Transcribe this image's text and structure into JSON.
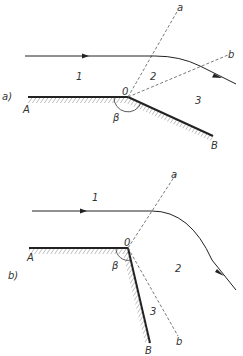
{
  "figure_a": {
    "tag": "a)",
    "region_labels": [
      "1",
      "2",
      "3"
    ],
    "point_labels": {
      "A": "A",
      "O": "0",
      "B": "B"
    },
    "line_labels": {
      "a": "a",
      "b": "b"
    },
    "angle_label": "β"
  },
  "figure_b": {
    "tag": "b)",
    "region_labels": [
      "1",
      "2",
      "3"
    ],
    "point_labels": {
      "A": "A",
      "O": "0",
      "B": "B"
    },
    "line_labels": {
      "a": "a",
      "b": "b"
    },
    "angle_label": "β"
  },
  "colors": {
    "line": "#222222",
    "dashed": "#555555",
    "hatch": "#555555"
  }
}
